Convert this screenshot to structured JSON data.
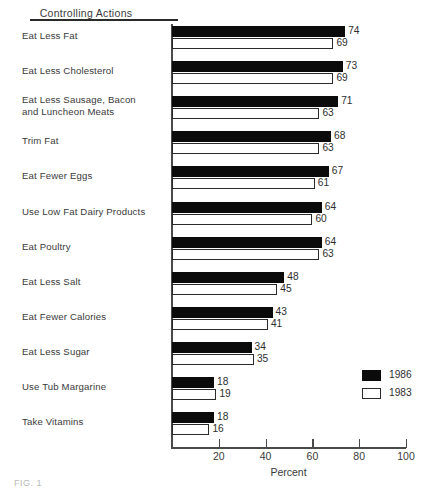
{
  "header": {
    "column_title": "Controlling Actions"
  },
  "figure": {
    "caption": "FIG. 1"
  },
  "legend": {
    "position": "bottom-right",
    "items": [
      {
        "label": "1986",
        "swatch": "filled-black-square",
        "color": "#0b0b0b"
      },
      {
        "label": "1983",
        "swatch": "outlined-white-square",
        "color": "#ffffff"
      }
    ]
  },
  "chart_data": {
    "type": "bar",
    "orientation": "horizontal",
    "title": "Controlling Actions",
    "xlabel": "Percent",
    "ylabel": "",
    "xlim": [
      0,
      100
    ],
    "xticks": [
      20,
      40,
      60,
      80,
      100
    ],
    "xtick_labels": [
      "20",
      "40",
      "60",
      "80",
      "100"
    ],
    "grid": false,
    "categories": [
      "Eat Less Fat",
      "Eat Less Cholesterol",
      "Eat Less Sausage, Bacon and Luncheon Meats",
      "Trim Fat",
      "Eat Fewer Eggs",
      "Use Low Fat Dairy Products",
      "Eat Poultry",
      "Eat Less Salt",
      "Eat Fewer Calories",
      "Eat Less Sugar",
      "Use Tub Margarine",
      "Take Vitamins"
    ],
    "category_lines": [
      [
        "Eat Less Fat"
      ],
      [
        "Eat Less Cholesterol"
      ],
      [
        "Eat Less Sausage, Bacon",
        "and Luncheon Meats"
      ],
      [
        "Trim Fat"
      ],
      [
        "Eat Fewer Eggs"
      ],
      [
        "Use Low Fat Dairy Products"
      ],
      [
        "Eat Poultry"
      ],
      [
        "Eat Less Salt"
      ],
      [
        "Eat Fewer Calories"
      ],
      [
        "Eat Less Sugar"
      ],
      [
        "Use Tub Margarine"
      ],
      [
        "Take Vitamins"
      ]
    ],
    "series": [
      {
        "name": "1986",
        "color": "#0b0b0b",
        "values": [
          74,
          73,
          71,
          68,
          67,
          64,
          64,
          48,
          43,
          34,
          18,
          18
        ]
      },
      {
        "name": "1983",
        "color": "#ffffff",
        "values": [
          69,
          69,
          63,
          63,
          61,
          60,
          63,
          45,
          41,
          35,
          19,
          16
        ]
      }
    ]
  }
}
